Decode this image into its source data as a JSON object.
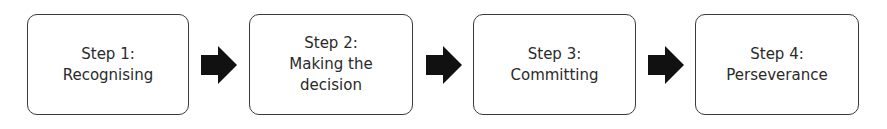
{
  "diagram": {
    "type": "process-flow",
    "steps": [
      {
        "title": "Step 1:",
        "lines": [
          "Recognising"
        ]
      },
      {
        "title": "Step 2:",
        "lines": [
          "Making the",
          "decision"
        ]
      },
      {
        "title": "Step 3:",
        "lines": [
          "Committing"
        ]
      },
      {
        "title": "Step 4:",
        "lines": [
          "Perseverance"
        ]
      }
    ],
    "arrow_icon": "right-block-arrow",
    "colors": {
      "border": "#3a3a3a",
      "arrow": "#111111",
      "text": "#2a2a2a"
    }
  }
}
